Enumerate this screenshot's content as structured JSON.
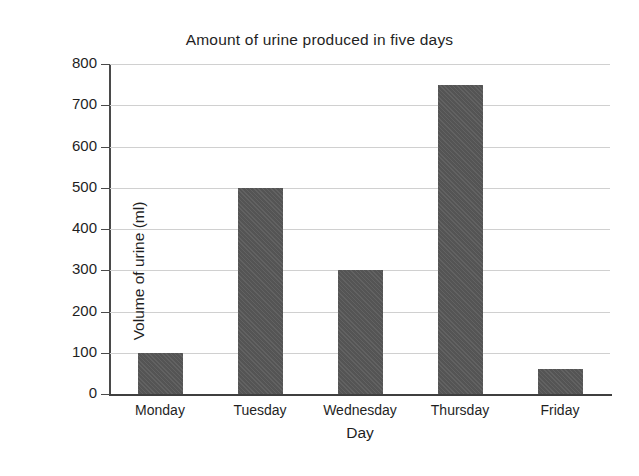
{
  "chart_data": {
    "type": "bar",
    "title": "Amount of urine produced in five days",
    "xlabel": "Day",
    "ylabel": "Volume of urine (ml)",
    "categories": [
      "Monday",
      "Tuesday",
      "Wednesday",
      "Thursday",
      "Friday"
    ],
    "values": [
      100,
      500,
      300,
      750,
      60
    ],
    "ylim": [
      0,
      800
    ],
    "ytick_labels": [
      "0",
      "100",
      "200",
      "300",
      "400",
      "500",
      "600",
      "700",
      "800"
    ],
    "ytick_values": [
      0,
      100,
      200,
      300,
      400,
      500,
      600,
      700,
      800
    ],
    "grid": true,
    "legend": false,
    "bar_color": "#595959",
    "gridline_color": "#d0d0d0",
    "axis_color": "#4a4a4a",
    "background_color": "#ffffff"
  }
}
